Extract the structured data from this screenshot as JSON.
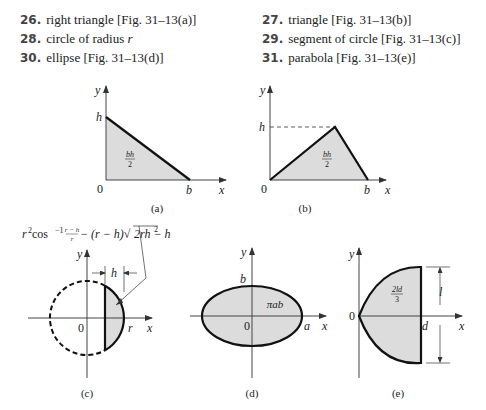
{
  "exercises": [
    {
      "number": "26.",
      "text": "right triangle [Fig. 31–13(a)]"
    },
    {
      "number": "27.",
      "text": "triangle [Fig. 31–13(b)]"
    },
    {
      "number": "28.",
      "text": "circle of radius ",
      "var": "r"
    },
    {
      "number": "29.",
      "text": "segment of circle [Fig. 31–13(c)]"
    },
    {
      "number": "30.",
      "text": "ellipse [Fig. 31–13(d)]"
    },
    {
      "number": "31.",
      "text": "parabola [Fig. 31–13(e)]"
    }
  ],
  "figures": {
    "a": {
      "caption": "(a)",
      "y_label": "y",
      "x_label": "x",
      "h_label": "h",
      "b_label": "b",
      "origin": "0",
      "area_num": "bh",
      "area_den": "2"
    },
    "b": {
      "caption": "(b)",
      "y_label": "y",
      "x_label": "x",
      "h_label": "h",
      "b_label": "b",
      "origin": "0",
      "area_num": "bh",
      "area_den": "2"
    },
    "c": {
      "caption": "(c)",
      "y_label": "y",
      "x_label": "x",
      "h_label": "h",
      "r_label": "r",
      "origin": "0",
      "formula": {
        "part1": "r",
        "sup2": "2",
        "cos": " cos",
        "supm1": "−1",
        "frac_num": "r − h",
        "frac_den": "r",
        "part2": " − (r − h)√",
        "radicand": "2rh − h",
        "sup2b": "2"
      }
    },
    "d": {
      "caption": "(d)",
      "y_label": "y",
      "x_label": "x",
      "a_label": "a",
      "b_label": "b",
      "origin": "0",
      "area": "πab"
    },
    "e": {
      "caption": "(e)",
      "y_label": "y",
      "x_label": "x",
      "d_label": "d",
      "l_label": "l",
      "origin": "0",
      "area_num": "2ld",
      "area_den": "3"
    }
  },
  "colors": {
    "fill": "#dcdcdc",
    "stroke": "#111111",
    "axis": "#444444"
  }
}
